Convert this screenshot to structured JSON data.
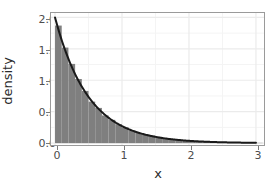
{
  "chart_data": {
    "type": "bar",
    "title": "",
    "subtitle": "",
    "xlabel": "x",
    "ylabel": "density",
    "xlim": [
      -0.06,
      3.12
    ],
    "ylim": [
      -0.03,
      2.07
    ],
    "grid": true,
    "legend": null,
    "x_ticks": [
      {
        "value": 0,
        "label": "0"
      },
      {
        "value": 1,
        "label": "1"
      },
      {
        "value": 2,
        "label": "2"
      },
      {
        "value": 3,
        "label": "3"
      }
    ],
    "y_ticks": [
      {
        "value": 0.0,
        "label": "0.0"
      },
      {
        "value": 0.5,
        "label": "0.5"
      },
      {
        "value": 1.0,
        "label": "1.0"
      },
      {
        "value": 1.5,
        "label": "1.5"
      },
      {
        "value": 2.0,
        "label": "2.0"
      }
    ],
    "x_minor_ticks": [
      0.5,
      1.5,
      2.5
    ],
    "y_minor_ticks": [
      0.25,
      0.75,
      1.25,
      1.75
    ],
    "series": [
      {
        "name": "histogram",
        "type": "bar",
        "style": "histogram density bars",
        "fill_color": "#7f7f7f",
        "bin_width": 0.1,
        "bin_starts": [
          0.0,
          0.1,
          0.2,
          0.3,
          0.4,
          0.5,
          0.6,
          0.7,
          0.8,
          0.9,
          1.0,
          1.1,
          1.2,
          1.3,
          1.4,
          1.5,
          1.6,
          1.7,
          1.8,
          1.9,
          2.0,
          2.1,
          2.2,
          2.3,
          2.4,
          2.5,
          2.6,
          2.7,
          2.8,
          2.9,
          3.0
        ],
        "values": [
          1.87,
          1.52,
          1.26,
          1.02,
          0.83,
          0.66,
          0.56,
          0.44,
          0.37,
          0.3,
          0.25,
          0.2,
          0.16,
          0.14,
          0.12,
          0.1,
          0.08,
          0.06,
          0.05,
          0.04,
          0.035,
          0.03,
          0.025,
          0.02,
          0.015,
          0.012,
          0.01,
          0.008,
          0.006,
          0.005,
          0.004
        ]
      },
      {
        "name": "exponential-density-curve",
        "type": "line",
        "style": "overlaid theoretical density, rate = 2",
        "line_color": "#1a1a1a",
        "line_width": 2,
        "formula": "2 * exp(-2 * x)",
        "x": [
          0.0,
          0.1,
          0.2,
          0.3,
          0.4,
          0.5,
          0.6,
          0.7,
          0.8,
          0.9,
          1.0,
          1.1,
          1.2,
          1.3,
          1.4,
          1.5,
          1.6,
          1.7,
          1.8,
          1.9,
          2.0,
          2.2,
          2.4,
          2.6,
          2.8,
          3.0
        ],
        "values": [
          2.0,
          1.637,
          1.341,
          1.098,
          0.899,
          0.736,
          0.602,
          0.493,
          0.404,
          0.331,
          0.271,
          0.222,
          0.181,
          0.149,
          0.122,
          0.1,
          0.082,
          0.067,
          0.055,
          0.045,
          0.037,
          0.025,
          0.016,
          0.011,
          0.007,
          0.005
        ]
      }
    ],
    "colors": {
      "bar_fill": "#7f7f7f",
      "curve": "#1a1a1a",
      "panel_background": "#ffffff",
      "panel_border": "#9a9a9a",
      "major_gridline": "#ebebeb",
      "minor_gridline": "#f4f4f4",
      "tick_label": "#4d4d4d",
      "axis_title": "#2b2b2b"
    }
  },
  "axes": {
    "y_title": "density",
    "x_title": "x"
  }
}
